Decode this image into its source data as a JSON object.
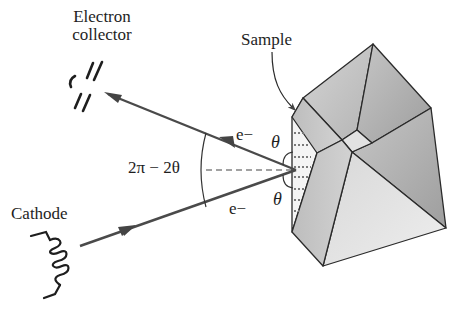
{
  "labels": {
    "electron_collector_line1": "Electron",
    "electron_collector_line2": "collector",
    "sample": "Sample",
    "cathode": "Cathode",
    "electron_out": "e−",
    "electron_in": "e−",
    "theta_top": "θ",
    "theta_bottom": "θ",
    "angle": "2π − 2θ"
  },
  "colors": {
    "line": "#2a2a2a",
    "arrow": "#555555",
    "face_light": "#e6e6e6",
    "face_mid": "#c8c8c8",
    "face_dark": "#a8a8a8",
    "dots": "#888888"
  }
}
